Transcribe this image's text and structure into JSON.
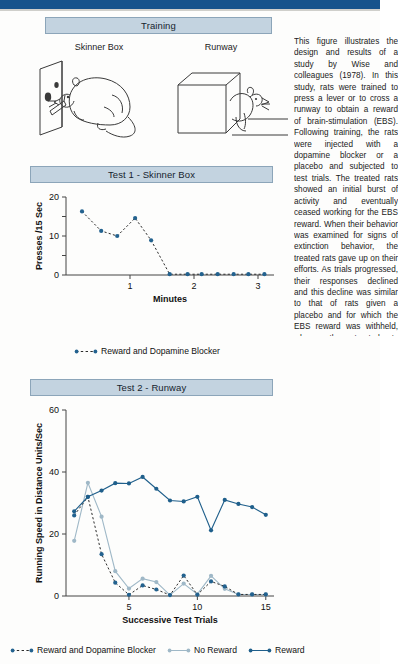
{
  "colors": {
    "top_rule": "#16538c",
    "banner_fill": "#c3d3e0",
    "banner_border": "#8ca5b9",
    "reward_dark_blue": "#1f5f8b",
    "marker_blue": "#23628f",
    "no_reward_gray": "#9fb8c7",
    "blocker_dashed": "#2b2b2b",
    "axis": "#444444"
  },
  "banners": {
    "training": "Training",
    "test1": "Test 1 - Skinner Box",
    "test2": "Test 2 - Runway"
  },
  "illustrations": {
    "skinner_label": "Skinner Box",
    "runway_label": "Runway",
    "skinner_icon": "rat-pressing-lever-illustration",
    "runway_icon": "rat-exiting-start-box-illustration"
  },
  "caption": {
    "text": "This figure illustrates the design and results of a study by Wise and colleagues (1978). In this study, rats were trained to press a lever or to cross a runway to obtain a reward of brain-stimulation (EBS). Following training, the rats were injected with a dopamine blocker or a placebo and subjected to test trials. The treated rats showed an initial burst of activity and eventually ceased working for the EBS reward. When their behavior was examined for signs of extinction behavior, the treated rats gave up on their efforts. As trials progressed, their responses declined and this decline was similar to that of rats given a placebo and for which the EBS reward was withheld, whereas the untreated rats receiving their rewards kept up a steady response rate."
  },
  "chart_data": [
    {
      "id": "test1",
      "type": "line",
      "title": "Test 1 - Skinner Box",
      "xlabel": "Minutes",
      "ylabel": "Presses /15 Sec",
      "xlim": [
        0,
        3.25
      ],
      "ylim": [
        0,
        20
      ],
      "xticks": [
        1,
        2,
        3
      ],
      "xtick_labels": [
        "1",
        "2",
        "3"
      ],
      "yticks": [
        0,
        5,
        10,
        15,
        20
      ],
      "ytick_labels": [
        "0",
        "",
        "10",
        "",
        "20"
      ],
      "grid": false,
      "legend_position": "below",
      "series": [
        {
          "name": "Reward and Dopamine Blocker",
          "style": "dashed",
          "color": "#23628f",
          "x": [
            0.25,
            0.55,
            0.8,
            1.08,
            1.33,
            1.62,
            1.9,
            2.12,
            2.37,
            2.62,
            2.85,
            3.1
          ],
          "y": [
            16.3,
            11.3,
            10.0,
            14.6,
            8.9,
            0.2,
            0.2,
            0.2,
            0.2,
            0.2,
            0.2,
            0.2
          ]
        }
      ]
    },
    {
      "id": "test2",
      "type": "line",
      "title": "Test 2 - Runway",
      "xlabel": "Successive Test Trials",
      "ylabel": "Running Speed in Distance Units/Sec",
      "xlim": [
        0.4,
        15.6
      ],
      "ylim": [
        0,
        60
      ],
      "xticks": [
        5,
        10,
        15
      ],
      "xtick_labels": [
        "5",
        "10",
        "15"
      ],
      "yticks": [
        0,
        20,
        40,
        60
      ],
      "ytick_labels": [
        "0",
        "20",
        "40",
        "60"
      ],
      "grid": false,
      "legend_position": "below",
      "series": [
        {
          "name": "Reward and Dopamine Blocker",
          "style": "dashed",
          "color": "#23628f",
          "x": [
            1,
            2,
            3,
            4,
            5,
            6,
            7,
            8,
            9,
            10,
            11,
            12,
            13,
            14,
            15
          ],
          "y": [
            26.0,
            32.0,
            13.5,
            4.3,
            0.4,
            3.4,
            2.1,
            0.3,
            6.6,
            0.4,
            4.7,
            3.1,
            0.5,
            0.5,
            0.5
          ]
        },
        {
          "name": "No Reward",
          "style": "solid",
          "color": "#9fb8c7",
          "x": [
            1,
            2,
            3,
            4,
            5,
            6,
            7,
            8,
            9,
            10,
            11,
            12,
            13,
            14,
            15
          ],
          "y": [
            17.8,
            36.5,
            25.6,
            8.0,
            2.4,
            5.6,
            4.5,
            0.3,
            4.0,
            0.6,
            6.5,
            2.3,
            0.5,
            0.5,
            0.5
          ]
        },
        {
          "name": "Reward",
          "style": "solid",
          "color": "#1f5f8b",
          "x": [
            1,
            2,
            3,
            4,
            5,
            6,
            7,
            8,
            9,
            10,
            11,
            12,
            13,
            14,
            15
          ],
          "y": [
            27.3,
            32.0,
            34.0,
            36.4,
            36.3,
            38.4,
            34.6,
            30.8,
            30.5,
            32.0,
            21.2,
            31.0,
            29.7,
            28.7,
            26.2
          ]
        }
      ]
    }
  ],
  "legends": {
    "test1": [
      {
        "label": "Reward and Dopamine Blocker",
        "style": "dashed",
        "color": "#23628f"
      }
    ],
    "test2": [
      {
        "label": "Reward and Dopamine Blocker",
        "style": "dashed",
        "color": "#23628f"
      },
      {
        "label": "No Reward",
        "style": "solid",
        "color": "#9fb8c7"
      },
      {
        "label": "Reward",
        "style": "solid",
        "color": "#1f5f8b"
      }
    ]
  }
}
